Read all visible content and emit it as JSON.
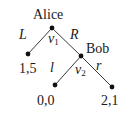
{
  "diagram": {
    "type": "extensive-form-game-tree",
    "players": [
      {
        "id": "alice",
        "name": "Alice"
      },
      {
        "id": "bob",
        "name": "Bob"
      }
    ],
    "nodes": [
      {
        "id": "v1",
        "player": "Alice",
        "label": "ν",
        "subscript": "1"
      },
      {
        "id": "v2",
        "player": "Bob",
        "label": "ν",
        "subscript": "2"
      },
      {
        "id": "leaf_L",
        "payoff": "1,5"
      },
      {
        "id": "leaf_Rl",
        "payoff": "0,0"
      },
      {
        "id": "leaf_Rr",
        "payoff": "2,1"
      }
    ],
    "edges": [
      {
        "from": "v1",
        "to": "leaf_L",
        "action": "L"
      },
      {
        "from": "v1",
        "to": "v2",
        "action": "R"
      },
      {
        "from": "v2",
        "to": "leaf_Rl",
        "action": "l"
      },
      {
        "from": "v2",
        "to": "leaf_Rr",
        "action": "r"
      }
    ]
  },
  "labels": {
    "alice": "Alice",
    "bob": "Bob",
    "action_L": "L",
    "action_R": "R",
    "action_l": "l",
    "action_r": "r",
    "v1_main": "ν",
    "v1_sub": "1",
    "v2_main": "ν",
    "v2_sub": "2",
    "payoff_L": "1,5",
    "payoff_Rl": "0,0",
    "payoff_Rr": "2,1"
  }
}
